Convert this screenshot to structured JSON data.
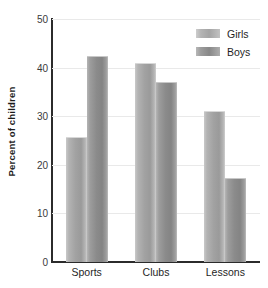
{
  "chart_data": {
    "type": "bar",
    "title": "",
    "xlabel": "",
    "ylabel": "Percent of children",
    "categories": [
      "Sports",
      "Clubs",
      "Lessons"
    ],
    "series": [
      {
        "name": "Girls",
        "values": [
          25.5,
          40.7,
          30.8
        ],
        "color": "#a6a6a6"
      },
      {
        "name": "Boys",
        "values": [
          42.2,
          36.9,
          17.0
        ],
        "color": "#8d8d8d"
      }
    ],
    "ylim": [
      0,
      50
    ],
    "yticks": [
      0,
      10,
      20,
      30,
      40,
      50
    ],
    "ytick_labels": [
      "0",
      "10",
      "20",
      "30",
      "40",
      "50"
    ],
    "grid": true,
    "legend_position": "top-right",
    "legend_entries": [
      "Girls",
      "Boys"
    ]
  },
  "axis": {
    "y_label": "Percent of children"
  }
}
